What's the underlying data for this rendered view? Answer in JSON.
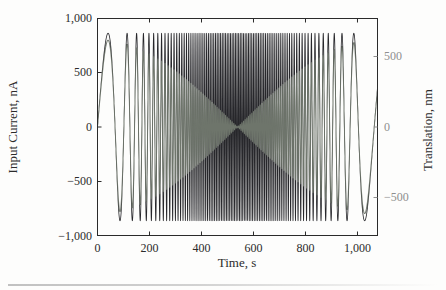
{
  "figure": {
    "background": "#fdfdfc",
    "frame_color": "#2a2a2a",
    "tick_color": "#2a2a2a",
    "right_axis_text_color": "#8f8f8f",
    "artifact_line_color": "#b5b5b5"
  },
  "chart_data": {
    "type": "line",
    "title": "",
    "xlabel": "Time, s",
    "ylabel_left": "Input Current, nA",
    "ylabel_right": "Translation, nm",
    "grid": false,
    "legend": null,
    "x_range_s": [
      0,
      1077
    ],
    "y_left_range_nA": [
      -1000,
      1000
    ],
    "y_right_range_nm": [
      -773,
      773
    ],
    "x_ticks": {
      "values": [
        0,
        200,
        400,
        600,
        800,
        1000
      ],
      "labels": [
        "0",
        "200",
        "400",
        "600",
        "800",
        "1,000"
      ]
    },
    "y_left_ticks": {
      "values": [
        1000,
        500,
        0,
        -500,
        -1000
      ],
      "labels": [
        "1,000",
        "500",
        "0",
        "−500",
        "−1,000"
      ]
    },
    "y_right_ticks": {
      "values": [
        500,
        0,
        -500
      ],
      "labels": [
        "500",
        "0",
        "−500"
      ]
    },
    "series": [
      {
        "name": "input-current",
        "axis": "left",
        "color": "#1b1b20",
        "waveform": "chirp",
        "amplitude_nA": 860,
        "freq_min_hz": 0.0054,
        "freq_max_hz": 0.16,
        "freq_profile": "sin2-symmetric"
      },
      {
        "name": "translation",
        "axis": "right",
        "color": "#6e756b",
        "waveform": "chirp-amplitude-modulated",
        "amplitude_max_nm": 620,
        "amplitude_min_nm": 6,
        "amplitude_envelope": "abs-cos-pinch-at-center",
        "freq_min_hz": 0.0054,
        "freq_max_hz": 0.16,
        "freq_profile": "sin2-symmetric"
      }
    ]
  }
}
